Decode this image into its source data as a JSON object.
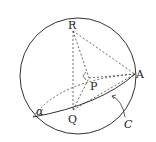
{
  "diagram": {
    "type": "sphere-geometry",
    "labels": {
      "R": "R",
      "A": "A",
      "P": "P",
      "Q": "Q",
      "alpha": "α",
      "C": "C"
    },
    "colors": {
      "stroke": "#333333",
      "background": "#ffffff"
    }
  }
}
